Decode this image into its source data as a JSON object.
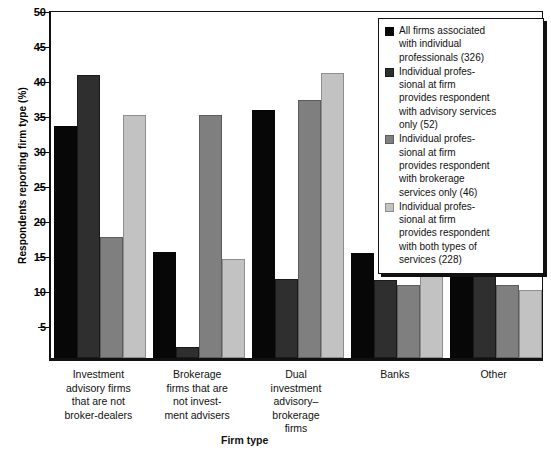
{
  "chart_data": {
    "type": "bar",
    "title": "",
    "xlabel": "Firm type",
    "ylabel": "Respondents reporting firm type (%)",
    "ylim": [
      0,
      50
    ],
    "yticks": [
      0,
      5,
      10,
      15,
      20,
      25,
      30,
      35,
      40,
      45,
      50
    ],
    "ytick_labels": [
      "",
      "5",
      "10",
      "15",
      "20",
      "25",
      "30",
      "35",
      "40",
      "45",
      "50"
    ],
    "grid": false,
    "legend_position": "top-right",
    "categories": [
      "Investment\nadvisory firms\nthat are not\nbroker-dealers",
      "Brokerage\nfirms that are\nnot invest-\nment advisers",
      "Dual\ninvestment\nadvisory–\nbrokerage\nfirms",
      "Banks",
      "Other"
    ],
    "series": [
      {
        "name": "All firms associated\nwith individual\nprofessionals (326)",
        "color": "#070707",
        "values": [
          33.2,
          15.1,
          35.4,
          15.0,
          15.7
        ]
      },
      {
        "name": "Individual profes-\nsional at firm\nprovides respondent\nwith advisory services\nonly (52)",
        "color": "#2f2f2f",
        "values": [
          40.4,
          1.6,
          11.3,
          11.1,
          45.9
        ]
      },
      {
        "name": "Individual profes-\nsional at firm\nprovides respondent\nwith brokerage\nservices only (46)",
        "color": "#7f7f7f",
        "values": [
          17.3,
          34.7,
          36.8,
          10.4,
          10.5
        ]
      },
      {
        "name": "Individual profes-\nsional at firm\nprovides respondent\nwith both types of\nservices (228)",
        "color": "#c2c2c2",
        "values": [
          34.7,
          14.2,
          40.7,
          16.8,
          9.7
        ]
      }
    ]
  }
}
